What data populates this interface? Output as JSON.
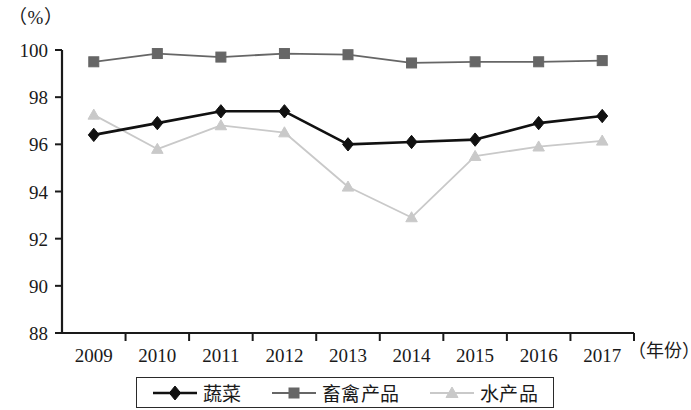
{
  "chart_data": {
    "type": "line",
    "title": "",
    "subtitle": "",
    "xlabel": "（年份）",
    "ylabel": "（%）",
    "ylim": [
      88,
      100
    ],
    "ytick_step": 2,
    "yticks": [
      "88",
      "90",
      "92",
      "94",
      "96",
      "98",
      "100"
    ],
    "grid": false,
    "legend_position": "bottom",
    "categories": [
      "2009",
      "2010",
      "2011",
      "2012",
      "2013",
      "2014",
      "2015",
      "2016",
      "2017"
    ],
    "series": [
      {
        "name": "蔬菜",
        "marker": "diamond",
        "color": "#111111",
        "values": [
          96.4,
          96.9,
          97.4,
          97.4,
          96.0,
          96.1,
          96.2,
          96.9,
          97.2
        ]
      },
      {
        "name": "畜禽产品",
        "marker": "square",
        "color": "#666666",
        "values": [
          99.5,
          99.85,
          99.7,
          99.85,
          99.8,
          99.45,
          99.5,
          99.5,
          99.55
        ]
      },
      {
        "name": "水产品",
        "marker": "triangle",
        "color": "#c9c9c9",
        "values": [
          97.25,
          95.8,
          96.8,
          96.5,
          94.2,
          92.9,
          95.5,
          95.9,
          96.15
        ]
      }
    ]
  },
  "axes": {
    "unit_label": "（%）",
    "x_axis_title": "（年份）"
  },
  "legend": {
    "items": [
      {
        "label": "蔬菜",
        "marker": "diamond-marker",
        "color": "#111111"
      },
      {
        "label": "畜禽产品",
        "marker": "square-marker",
        "color": "#666666"
      },
      {
        "label": "水产品",
        "marker": "triangle-marker",
        "color": "#c9c9c9"
      }
    ]
  }
}
